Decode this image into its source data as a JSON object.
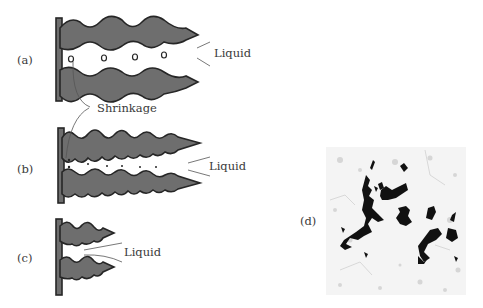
{
  "figure": {
    "panels": [
      {
        "id": "a",
        "label": "(a)",
        "annotation": "Liquid"
      },
      {
        "id": "b",
        "label": "(b)",
        "annotation": "Liquid"
      },
      {
        "id": "c",
        "label": "(c)",
        "annotation": "Liquid"
      },
      {
        "id": "d",
        "label": "(d)",
        "description": "micrograph of interdendritic shrinkage porosity"
      }
    ],
    "shared_annotation": "Shrinkage",
    "colors": {
      "dendrite": "#6e6e6e",
      "outline": "#262626",
      "text": "#3a3a3a",
      "pore": "#111111"
    }
  }
}
